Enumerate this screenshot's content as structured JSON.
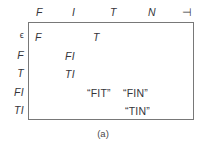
{
  "figure": {
    "caption": "(a)",
    "border_color": "#787878",
    "text_color": "#35353a",
    "background": "#ffffff"
  },
  "table": {
    "column_headers": [
      {
        "label": "F",
        "x": 8,
        "style": "italic"
      },
      {
        "label": "I",
        "x": 44,
        "style": "italic"
      },
      {
        "label": "T",
        "x": 82,
        "style": "italic"
      },
      {
        "label": "N",
        "x": 120,
        "style": "italic"
      },
      {
        "label": "⊣",
        "x": 154,
        "style": "endmark"
      }
    ],
    "row_labels": [
      {
        "label": "ϵ",
        "y": 8,
        "style": "epsilon"
      },
      {
        "label": "F",
        "y": 27,
        "style": "italic"
      },
      {
        "label": "T",
        "y": 45,
        "style": "italic"
      },
      {
        "label": "FI",
        "y": 64,
        "style": "italic"
      },
      {
        "label": "TI",
        "y": 82,
        "style": "italic"
      }
    ],
    "cells": [
      {
        "text": "F",
        "x": 6,
        "y": 8,
        "style": "italic"
      },
      {
        "text": "T",
        "x": 64,
        "y": 8,
        "style": "italic"
      },
      {
        "text": "FI",
        "x": 36,
        "y": 27,
        "style": "italic"
      },
      {
        "text": "TI",
        "x": 36,
        "y": 45,
        "style": "italic"
      },
      {
        "text": "“FIT”",
        "x": 58,
        "y": 64,
        "style": "quoted"
      },
      {
        "text": "“FIN”",
        "x": 94,
        "y": 64,
        "style": "quoted"
      },
      {
        "text": "“TIN”",
        "x": 96,
        "y": 82,
        "style": "quoted"
      }
    ]
  }
}
